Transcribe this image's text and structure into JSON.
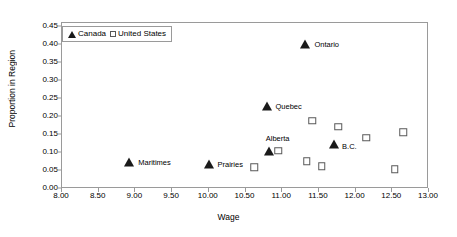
{
  "chart_data": {
    "type": "scatter",
    "title": "",
    "xlabel": "Wage",
    "ylabel": "Proportion in Region",
    "xlim": [
      8.0,
      13.0
    ],
    "ylim": [
      0.0,
      0.45
    ],
    "xticks": [
      "8.00",
      "8.50",
      "9.00",
      "9.50",
      "10.00",
      "10.50",
      "11.00",
      "11.50",
      "12.00",
      "12.50",
      "13.00"
    ],
    "xtick_values": [
      8.0,
      8.5,
      9.0,
      9.5,
      10.0,
      10.5,
      11.0,
      11.5,
      12.0,
      12.5,
      13.0
    ],
    "yticks": [
      "0.00",
      "0.05",
      "0.10",
      "0.15",
      "0.20",
      "0.25",
      "0.30",
      "0.35",
      "0.40",
      "0.45"
    ],
    "ytick_values": [
      0.0,
      0.05,
      0.1,
      0.15,
      0.2,
      0.25,
      0.3,
      0.35,
      0.4,
      0.45
    ],
    "grid": false,
    "legend_position": "top-left",
    "legend": [
      {
        "name": "Canada",
        "marker": "filled-triangle",
        "color": "#1a1a1a"
      },
      {
        "name": "United States",
        "marker": "open-square",
        "color": "#585858"
      }
    ],
    "series": [
      {
        "name": "Canada",
        "marker": "filled-triangle",
        "color": "#1a1a1a",
        "points": [
          {
            "label": "Maritimes",
            "x": 8.93,
            "y": 0.071,
            "label_dx": 9,
            "label_dy": -3
          },
          {
            "label": "Prairies",
            "x": 10.01,
            "y": 0.066,
            "label_dx": 9,
            "label_dy": -3
          },
          {
            "label": "Alberta",
            "x": 10.83,
            "y": 0.102,
            "label_dx": -3,
            "label_dy": -16
          },
          {
            "label": "Quebec",
            "x": 10.8,
            "y": 0.228,
            "label_dx": 9,
            "label_dy": -3
          },
          {
            "label": "Ontario",
            "x": 11.33,
            "y": 0.4,
            "label_dx": 9,
            "label_dy": -3
          },
          {
            "label": "B.C.",
            "x": 11.72,
            "y": 0.121,
            "label_dx": 8,
            "label_dy": -1
          }
        ]
      },
      {
        "name": "United States",
        "marker": "open-square",
        "color": "#585858",
        "points": [
          {
            "label": "",
            "x": 10.63,
            "y": 0.058
          },
          {
            "label": "",
            "x": 10.96,
            "y": 0.104
          },
          {
            "label": "",
            "x": 11.35,
            "y": 0.074
          },
          {
            "label": "",
            "x": 11.42,
            "y": 0.187
          },
          {
            "label": "",
            "x": 11.55,
            "y": 0.061
          },
          {
            "label": "",
            "x": 11.78,
            "y": 0.17
          },
          {
            "label": "",
            "x": 12.16,
            "y": 0.139
          },
          {
            "label": "",
            "x": 12.55,
            "y": 0.052
          },
          {
            "label": "",
            "x": 12.66,
            "y": 0.155
          }
        ]
      }
    ]
  }
}
